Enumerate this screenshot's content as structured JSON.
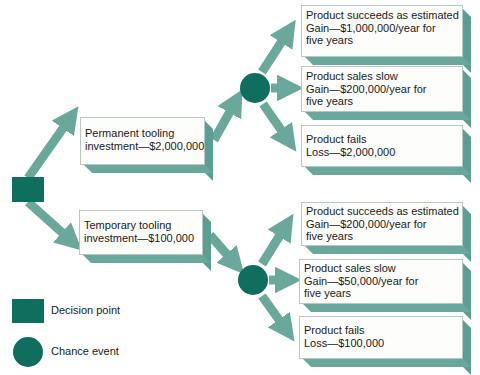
{
  "colors": {
    "node": "#0f6e5e",
    "arrow": "#6aa89c",
    "box_shadow": "#5b9e92",
    "box_bg": "#fdfdfb"
  },
  "decision_node": {
    "shape": "square"
  },
  "alternatives": [
    {
      "id": "permanent",
      "lines": [
        "Permanent tooling",
        "investment—$2,000,000"
      ],
      "outcomes": [
        {
          "lines": [
            "Product succeeds as estimated",
            "Gain—$1,000,000/year for",
            "five years"
          ]
        },
        {
          "lines": [
            "Product sales slow",
            "Gain—$200,000/year for",
            "five years"
          ]
        },
        {
          "lines": [
            "Product fails",
            "Loss—$2,000,000"
          ]
        }
      ]
    },
    {
      "id": "temporary",
      "lines": [
        "Temporary tooling",
        "investment—$100,000"
      ],
      "outcomes": [
        {
          "lines": [
            "Product succeeds as estimated",
            "Gain—$200,000/year for",
            "five years"
          ]
        },
        {
          "lines": [
            "Product sales slow",
            "Gain—$50,000/year for",
            "five years"
          ]
        },
        {
          "lines": [
            "Product fails",
            "Loss—$100,000"
          ]
        }
      ]
    }
  ],
  "legend": {
    "decision_label": "Decision point",
    "chance_label": "Chance event"
  }
}
